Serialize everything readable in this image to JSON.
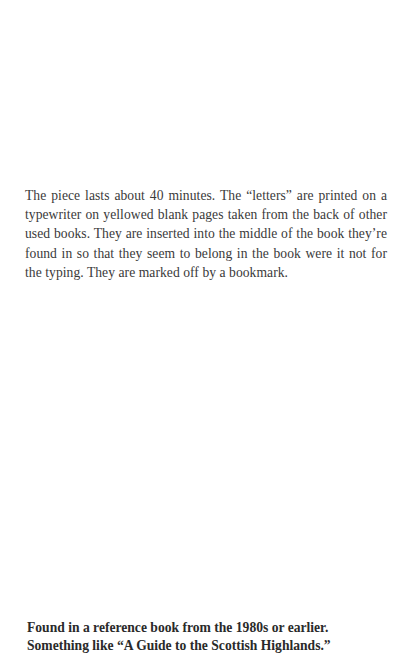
{
  "document": {
    "body_paragraph": "The piece lasts about 40 minutes. The “letters” are printed on a typewriter on yellowed blank pages taken from the back of other used books. They are inserted into the middle of the book they’re found in so that they seem to belong in the book were it not for the typing. They are marked off by a bookmark.",
    "note": {
      "lines": [
        "Found in a reference book from the 1980s or earlier.",
        "Something like “A Guide to the Scottish Highlands.”"
      ]
    }
  }
}
